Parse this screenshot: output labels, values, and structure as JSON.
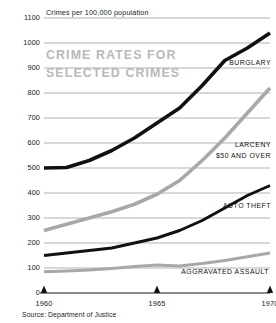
{
  "chart_data": {
    "type": "line",
    "title": "CRIME RATES FOR\nSELECTED CRIMES",
    "unit_caption": "Crimes per  100,000 population",
    "source": "Source: Department of Justice",
    "xlabel": "",
    "ylabel": "Crimes per 100,000 population",
    "xlim": [
      1960,
      1970
    ],
    "ylim": [
      0,
      1100
    ],
    "grid": true,
    "legend_position": "inline-right",
    "y_ticks": [
      0,
      100,
      200,
      300,
      400,
      500,
      600,
      700,
      800,
      900,
      1000,
      1100
    ],
    "y_tick_labels": [
      "0",
      "100",
      "200",
      "300",
      "400",
      "500",
      "600",
      "700",
      "800",
      "900",
      "1000",
      "1100"
    ],
    "x_ticks": [
      1960,
      1965,
      1970
    ],
    "x_tick_labels": [
      "1960",
      "1965",
      "1970"
    ],
    "x": [
      1960,
      1961,
      1962,
      1963,
      1964,
      1965,
      1966,
      1967,
      1968,
      1969,
      1970
    ],
    "series": [
      {
        "name": "BURGLARY",
        "color": "#111111",
        "width": 3.6,
        "values": [
          500,
          502,
          530,
          570,
          620,
          680,
          740,
          830,
          930,
          980,
          1040
        ]
      },
      {
        "name": "LARCENY\n$50 AND OVER",
        "label_line1": "LARCENY",
        "label_line2": "$50 AND OVER",
        "color": "#a8a8a8",
        "width": 3.6,
        "values": [
          250,
          275,
          300,
          325,
          355,
          395,
          450,
          530,
          620,
          720,
          820
        ]
      },
      {
        "name": "AUTO THEFT",
        "color": "#111111",
        "width": 3.0,
        "values": [
          150,
          160,
          170,
          180,
          200,
          220,
          250,
          290,
          340,
          390,
          430
        ]
      },
      {
        "name": "AGGRAVATED ASSAULT",
        "color": "#a8a8a8",
        "width": 3.0,
        "values": [
          85,
          88,
          92,
          98,
          106,
          112,
          108,
          118,
          130,
          145,
          160
        ]
      }
    ]
  }
}
